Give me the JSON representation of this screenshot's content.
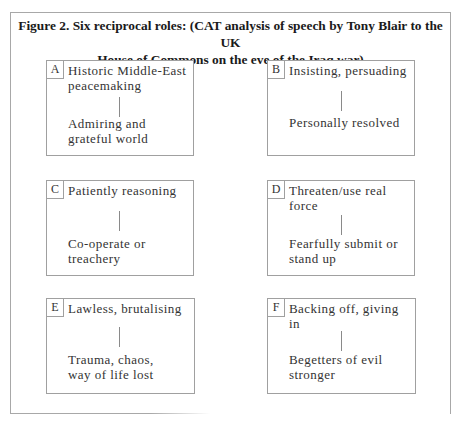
{
  "figure": {
    "title_line1": "Figure 2.  Six reciprocal roles: (CAT analysis of speech by Tony Blair to the UK",
    "title_line2": "House of Commons on the eve of the Iraq war)"
  },
  "roles": [
    {
      "letter": "A",
      "top": "Historic Middle-East\npeacemaking",
      "bottom": "Admiring and\ngrateful world"
    },
    {
      "letter": "B",
      "top": "Insisting, persuading",
      "bottom": "Personally resolved"
    },
    {
      "letter": "C",
      "top": "Patiently reasoning",
      "bottom": "Co-operate or\ntreachery"
    },
    {
      "letter": "D",
      "top": "Threaten/use real\nforce",
      "bottom": "Fearfully submit or\nstand up"
    },
    {
      "letter": "E",
      "top": "Lawless, brutalising",
      "bottom": "Trauma, chaos,\nway of life lost"
    },
    {
      "letter": "F",
      "top": "Backing off, giving\nin",
      "bottom": "Begetters of evil\nstronger"
    }
  ]
}
